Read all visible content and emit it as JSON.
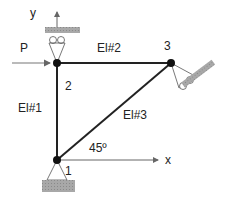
{
  "diagram": {
    "axes": {
      "x_label": "x",
      "y_label": "y"
    },
    "load": {
      "label": "P"
    },
    "elements": [
      {
        "label": "El#1"
      },
      {
        "label": "El#2"
      },
      {
        "label": "El#3"
      }
    ],
    "nodes": [
      {
        "label": "1"
      },
      {
        "label": "2"
      },
      {
        "label": "3"
      }
    ],
    "angle": {
      "label": "45º"
    },
    "colors": {
      "member": "#222222",
      "hatch": "#999999",
      "arrow": "#777777"
    }
  }
}
